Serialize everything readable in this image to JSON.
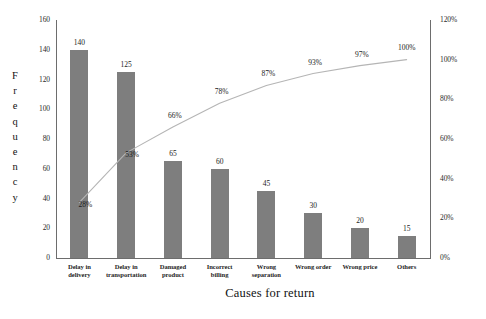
{
  "chart_data": {
    "type": "bar",
    "subtype": "pareto",
    "title": "",
    "xlabel": "Causes for return",
    "ylabel": "Frequency",
    "y2label": "",
    "categories": [
      "Delay in delivery",
      "Delay in transportation",
      "Damaged product",
      "Incorrect billing",
      "Wrong separation",
      "Wrong order",
      "Wrong price",
      "Others"
    ],
    "values": [
      140,
      125,
      65,
      60,
      45,
      30,
      20,
      15
    ],
    "cumulative_percent": [
      28,
      53,
      66,
      78,
      87,
      93,
      97,
      100
    ],
    "cumulative_percent_labels": [
      "28%",
      "53%",
      "66%",
      "78%",
      "87%",
      "93%",
      "97%",
      "100%"
    ],
    "bar_value_labels": [
      "140",
      "125",
      "65",
      "60",
      "45",
      "30",
      "20",
      "15"
    ],
    "ylim": [
      0,
      160
    ],
    "y2lim": [
      0,
      120
    ],
    "yticks": [
      0,
      20,
      40,
      60,
      80,
      100,
      120,
      140,
      160
    ],
    "ytick_labels": [
      "0",
      "20",
      "40",
      "60",
      "80",
      "100",
      "120",
      "140",
      "160"
    ],
    "y2ticks": [
      0,
      20,
      40,
      60,
      80,
      100,
      120
    ],
    "y2tick_labels": [
      "0%",
      "20%",
      "40%",
      "60%",
      "80%",
      "100%",
      "120%"
    ],
    "grid": false,
    "legend": false,
    "bar_color": "#7e7e7e",
    "line_color": "#b5b5b5",
    "axis_color": "#6d6d6d",
    "total": 500
  },
  "axes": {
    "y_title_letters": [
      "F",
      "r",
      "e",
      "q",
      "u",
      "e",
      "n",
      "c",
      "y"
    ],
    "y_title_text": "Frequency",
    "x_title_text": "Causes for return"
  }
}
